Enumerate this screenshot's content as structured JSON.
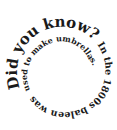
{
  "spiral": {
    "text_outer": "Did you know? In the 1800s baleen was",
    "text_inner": "used to make umbrellas.",
    "color": "#1a1a1a",
    "background": "#ffffff"
  }
}
